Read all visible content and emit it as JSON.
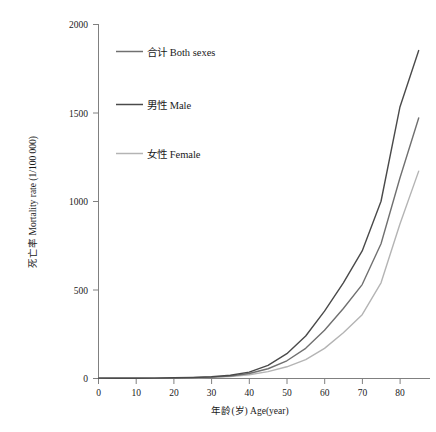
{
  "chart_data": {
    "type": "line",
    "title": "",
    "xlabel": "年龄(岁) Age(year)",
    "ylabel": "死亡率 Mortality rate (1/100 000)",
    "xlim": [
      0,
      88
    ],
    "ylim": [
      0,
      2000
    ],
    "x_ticks": [
      0,
      10,
      20,
      30,
      40,
      50,
      60,
      70,
      80
    ],
    "y_ticks": [
      0,
      500,
      1000,
      1500,
      2000
    ],
    "grid": false,
    "legend_position": "upper-left-inside",
    "x": [
      0,
      5,
      10,
      15,
      20,
      25,
      30,
      35,
      40,
      45,
      50,
      55,
      60,
      65,
      70,
      75,
      80,
      85
    ],
    "series": [
      {
        "name": "合计 Both sexes",
        "label": "合计 Both sexes",
        "color": "#707070",
        "values": [
          2,
          1,
          1,
          2,
          3,
          5,
          8,
          14,
          28,
          55,
          100,
          170,
          272,
          395,
          530,
          760,
          1130,
          1470
        ]
      },
      {
        "name": "男性 Male",
        "label": "男性 Male",
        "color": "#4a4a4a",
        "values": [
          2,
          1,
          1,
          2,
          4,
          6,
          10,
          18,
          36,
          74,
          140,
          240,
          380,
          540,
          720,
          1000,
          1530,
          1850
        ]
      },
      {
        "name": "女性 Female",
        "label": "女性 Female",
        "color": "#b4b4b4",
        "values": [
          2,
          1,
          1,
          2,
          3,
          4,
          7,
          11,
          21,
          39,
          66,
          106,
          170,
          258,
          360,
          540,
          870,
          1170
        ]
      }
    ]
  },
  "axis": {
    "y_tick_labels": [
      "0",
      "500",
      "1000",
      "1500",
      "2000"
    ],
    "x_tick_labels": [
      "0",
      "10",
      "20",
      "30",
      "40",
      "50",
      "60",
      "70",
      "80"
    ],
    "y_axis_title": "死亡率 Mortality rate (1/100 000)",
    "x_axis_title": "年龄(岁) Age(year)"
  },
  "legend": {
    "items": [
      {
        "label": "合计 Both sexes",
        "color": "#707070"
      },
      {
        "label": "男性 Male",
        "color": "#4a4a4a"
      },
      {
        "label": "女性 Female",
        "color": "#b4b4b4"
      }
    ]
  },
  "footer": {
    "caption": ""
  },
  "colors": {
    "axis": "#808080",
    "text": "#1a1a1a",
    "background": "#ffffff"
  }
}
